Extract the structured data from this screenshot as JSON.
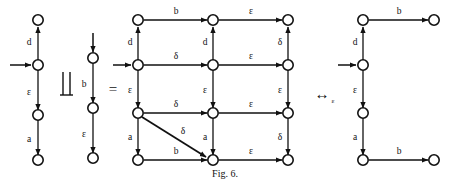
{
  "figure": {
    "caption": "Fig. 6.",
    "operators": {
      "parallel": "‖",
      "equals": "=",
      "bisim": "↔",
      "bisim_subscript": "ε"
    },
    "colors": {
      "ink": "#111111",
      "background": "#ffffff"
    }
  },
  "automaton_left": {
    "name": "left-automaton",
    "nodes": [
      {
        "id": "L0",
        "x": 38,
        "y": 20
      },
      {
        "id": "L1",
        "x": 38,
        "y": 65
      },
      {
        "id": "L2",
        "x": 38,
        "y": 115
      },
      {
        "id": "L3",
        "x": 38,
        "y": 160
      }
    ],
    "initial_node": "L1",
    "edges": [
      {
        "from": "L1",
        "to": "L0",
        "label": "d",
        "dir": "up"
      },
      {
        "from": "L1",
        "to": "L2",
        "label": "ε",
        "dir": "down"
      },
      {
        "from": "L2",
        "to": "L3",
        "label": "a",
        "dir": "down"
      }
    ]
  },
  "automaton_middle": {
    "name": "middle-automaton",
    "nodes": [
      {
        "id": "M0",
        "x": 93,
        "y": 58
      },
      {
        "id": "M1",
        "x": 93,
        "y": 108
      },
      {
        "id": "M2",
        "x": 93,
        "y": 158
      }
    ],
    "initial_node": "M0",
    "edges": [
      {
        "from": "M0",
        "to": "M1",
        "label": "b",
        "dir": "down"
      },
      {
        "from": "M1",
        "to": "M2",
        "label": "ε",
        "dir": "down"
      }
    ]
  },
  "automaton_product": {
    "name": "product-automaton",
    "columns_x": [
      138,
      213,
      288
    ],
    "rows_y": [
      20,
      65,
      113,
      160
    ],
    "initial_node": "P-r1-c1",
    "horizontal_edges": [
      {
        "row": 0,
        "from_col": 0,
        "to_col": 1,
        "label": "b"
      },
      {
        "row": 0,
        "from_col": 1,
        "to_col": 2,
        "label": "ε"
      },
      {
        "row": 1,
        "from_col": 0,
        "to_col": 1,
        "label": "δ"
      },
      {
        "row": 1,
        "from_col": 1,
        "to_col": 2,
        "label": "ε"
      },
      {
        "row": 2,
        "from_col": 0,
        "to_col": 1,
        "label": "δ"
      },
      {
        "row": 2,
        "from_col": 1,
        "to_col": 2,
        "label": "ε"
      },
      {
        "row": 3,
        "from_col": 0,
        "to_col": 1,
        "label": "b"
      },
      {
        "row": 3,
        "from_col": 1,
        "to_col": 2,
        "label": "ε"
      }
    ],
    "vertical_edges": [
      {
        "col": 0,
        "from_row": 1,
        "to_row": 0,
        "label": "d",
        "dir": "up"
      },
      {
        "col": 0,
        "from_row": 1,
        "to_row": 2,
        "label": "ε",
        "dir": "down"
      },
      {
        "col": 0,
        "from_row": 2,
        "to_row": 3,
        "label": "a",
        "dir": "down"
      },
      {
        "col": 1,
        "from_row": 1,
        "to_row": 0,
        "label": "d",
        "dir": "up"
      },
      {
        "col": 1,
        "from_row": 1,
        "to_row": 2,
        "label": "ε",
        "dir": "down"
      },
      {
        "col": 1,
        "from_row": 2,
        "to_row": 3,
        "label": "a",
        "dir": "down"
      },
      {
        "col": 2,
        "from_row": 1,
        "to_row": 0,
        "label": "δ",
        "dir": "up"
      },
      {
        "col": 2,
        "from_row": 1,
        "to_row": 2,
        "label": "ε",
        "dir": "down"
      },
      {
        "col": 2,
        "from_row": 2,
        "to_row": 3,
        "label": "δ",
        "dir": "down"
      }
    ],
    "diagonal_edges": [
      {
        "from_row": 2,
        "from_col": 0,
        "to_row": 3,
        "to_col": 1,
        "label": "δ"
      }
    ]
  },
  "automaton_right": {
    "name": "right-automaton",
    "nodes": [
      {
        "id": "R0",
        "x": 363,
        "y": 20
      },
      {
        "id": "R1",
        "x": 363,
        "y": 65
      },
      {
        "id": "R2",
        "x": 363,
        "y": 113
      },
      {
        "id": "R3",
        "x": 363,
        "y": 160
      },
      {
        "id": "R4",
        "x": 434,
        "y": 20
      },
      {
        "id": "R5",
        "x": 434,
        "y": 160
      }
    ],
    "initial_node": "R1",
    "edges": [
      {
        "from": "R1",
        "to": "R0",
        "label": "d",
        "dir": "up"
      },
      {
        "from": "R1",
        "to": "R2",
        "label": "ε",
        "dir": "down"
      },
      {
        "from": "R2",
        "to": "R3",
        "label": "a",
        "dir": "down"
      },
      {
        "from": "R0",
        "to": "R4",
        "label": "b",
        "dir": "right"
      },
      {
        "from": "R3",
        "to": "R5",
        "label": "b",
        "dir": "right"
      }
    ]
  }
}
